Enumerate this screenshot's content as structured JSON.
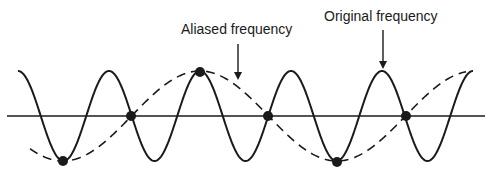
{
  "diagram": {
    "labels": {
      "aliased": "Aliased frequency",
      "original": "Original frequency"
    },
    "axis": {
      "y": 116,
      "x_start": 7,
      "x_end": 485
    },
    "original_wave": {
      "style": "solid",
      "amplitude": 45,
      "period": 91,
      "peak_x": 200,
      "x_start": 18,
      "x_end": 473
    },
    "aliased_wave": {
      "style": "dashed",
      "amplitude": 45,
      "period": 274,
      "peak_x": 200,
      "x_start": 30,
      "x_end": 466
    },
    "sample_points": [
      {
        "x": 63,
        "y": 161
      },
      {
        "x": 131,
        "y": 116
      },
      {
        "x": 200,
        "y": 72
      },
      {
        "x": 268,
        "y": 116
      },
      {
        "x": 337,
        "y": 162
      },
      {
        "x": 406,
        "y": 116
      }
    ],
    "arrows": [
      {
        "name": "aliased",
        "x": 238,
        "y1": 44,
        "y2": 80
      },
      {
        "name": "original",
        "x": 383,
        "y1": 30,
        "y2": 69
      }
    ],
    "colors": {
      "line": "#1a1a1a",
      "background": "#ffffff"
    }
  }
}
